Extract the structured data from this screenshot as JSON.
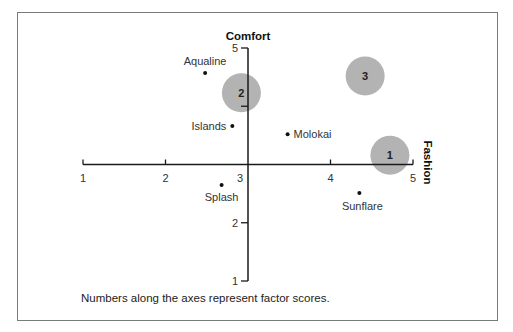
{
  "chart_data": {
    "type": "scatter",
    "title": "",
    "xlabel": "Fashion",
    "ylabel": "Comfort",
    "xlim": [
      1,
      5
    ],
    "ylim": [
      1,
      5
    ],
    "axes_cross_at": {
      "x": 3,
      "y": 3
    },
    "x_ticks": [
      "1",
      "2",
      "3",
      "4",
      "5"
    ],
    "y_ticks": [
      "1",
      "2",
      "3",
      "4",
      "5"
    ],
    "grid": false,
    "legend": null,
    "points": [
      {
        "label": "Aqualine",
        "x": 2.48,
        "y": 4.57
      },
      {
        "label": "Islands",
        "x": 2.81,
        "y": 3.66
      },
      {
        "label": "Molokai",
        "x": 3.48,
        "y": 3.52
      },
      {
        "label": "Splash",
        "x": 2.68,
        "y": 2.65
      },
      {
        "label": "Sunflare",
        "x": 4.35,
        "y": 2.51
      }
    ],
    "ideal_points": [
      {
        "label": "1",
        "x": 4.72,
        "y": 3.16
      },
      {
        "label": "2",
        "x": 2.92,
        "y": 4.23
      },
      {
        "label": "3",
        "x": 4.42,
        "y": 4.52
      }
    ],
    "annotations": [
      "Numbers along the axes represent factor scores."
    ]
  },
  "colors": {
    "axis": "#1a1a1a",
    "circle_fill": "#b3b3b3",
    "text": "#222222",
    "border": "#7a7a7a"
  },
  "caption": "Numbers along the axes represent factor scores."
}
